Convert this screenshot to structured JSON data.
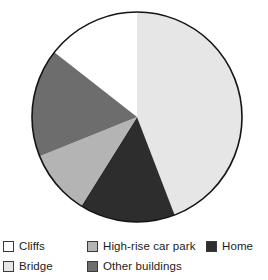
{
  "chart_data": {
    "type": "pie",
    "title": "",
    "subtitle": "",
    "xlabel": "",
    "ylabel": "",
    "grid": false,
    "legend_position": "bottom",
    "categories": [
      "Cliffs",
      "Bridge",
      "High-rise car park",
      "Other buildings",
      "Home"
    ],
    "values": [
      14,
      44,
      10,
      17,
      15
    ],
    "units": "percent",
    "slices": [
      {
        "label": "Cliffs",
        "value": 14,
        "color": "#ffffff",
        "start_angle": 308,
        "end_angle": 360
      },
      {
        "label": "Bridge",
        "value": 44,
        "color": "#e6e6e6",
        "start_angle": 0,
        "end_angle": 159
      },
      {
        "label": "Home",
        "value": 15,
        "color": "#2d2d2d",
        "start_angle": 159,
        "end_angle": 212
      },
      {
        "label": "High-rise car park",
        "value": 10,
        "color": "#b4b4b4",
        "start_angle": 212,
        "end_angle": 248
      },
      {
        "label": "Other buildings",
        "value": 17,
        "color": "#6d6d6d",
        "start_angle": 248,
        "end_angle": 308
      }
    ],
    "geometry": {
      "cx": 137,
      "cy": 117,
      "r": 105,
      "stroke": "#141414",
      "stroke_width": 1.6
    }
  },
  "legend": {
    "rows": [
      [
        {
          "label": "Cliffs",
          "color": "#ffffff",
          "swatch_name": "legend-swatch-cliffs"
        },
        {
          "label": "High-rise car park",
          "color": "#b4b4b4",
          "swatch_name": "legend-swatch-high-rise-car-park"
        },
        {
          "label": "Home",
          "color": "#2d2d2d",
          "swatch_name": "legend-swatch-home"
        }
      ],
      [
        {
          "label": "Bridge",
          "color": "#e6e6e6",
          "swatch_name": "legend-swatch-bridge"
        },
        {
          "label": "Other buildings",
          "color": "#6d6d6d",
          "swatch_name": "legend-swatch-other-buildings"
        }
      ]
    ]
  },
  "colors": {
    "cliffs": "#ffffff",
    "bridge": "#e6e6e6",
    "high_rise_car_park": "#b4b4b4",
    "other_buildings": "#6d6d6d",
    "home": "#2d2d2d",
    "outline": "#141414",
    "text": "#1c1c1c",
    "background": "#ffffff"
  }
}
